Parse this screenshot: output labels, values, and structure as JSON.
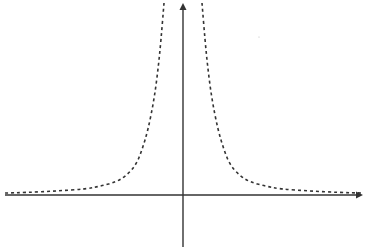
{
  "diagram": {
    "type": "function-graph",
    "colors": {
      "background": "#ffffff",
      "axis": "#333333",
      "curve": "#333333"
    },
    "axes": {
      "x_axis": {
        "y": 195,
        "x_start": 5,
        "x_end": 363,
        "arrow": "right"
      },
      "y_axis": {
        "x": 183,
        "y_start": 3,
        "y_end": 247,
        "arrow": "up"
      }
    },
    "curve": {
      "style": "dashed",
      "right_branch": [
        [
          202,
          3
        ],
        [
          205,
          40
        ],
        [
          208,
          70
        ],
        [
          212,
          100
        ],
        [
          218,
          130
        ],
        [
          224,
          150
        ],
        [
          230,
          165
        ],
        [
          240,
          176
        ],
        [
          250,
          182
        ],
        [
          265,
          186
        ],
        [
          280,
          189
        ],
        [
          310,
          191
        ],
        [
          340,
          192.5
        ],
        [
          362,
          193
        ]
      ],
      "left_branch": [
        [
          164,
          3
        ],
        [
          161,
          40
        ],
        [
          158,
          70
        ],
        [
          154,
          100
        ],
        [
          148,
          130
        ],
        [
          142,
          150
        ],
        [
          136,
          165
        ],
        [
          126,
          176
        ],
        [
          116,
          182
        ],
        [
          101,
          186
        ],
        [
          86,
          189
        ],
        [
          56,
          191
        ],
        [
          26,
          192.5
        ],
        [
          5,
          193
        ]
      ]
    }
  }
}
